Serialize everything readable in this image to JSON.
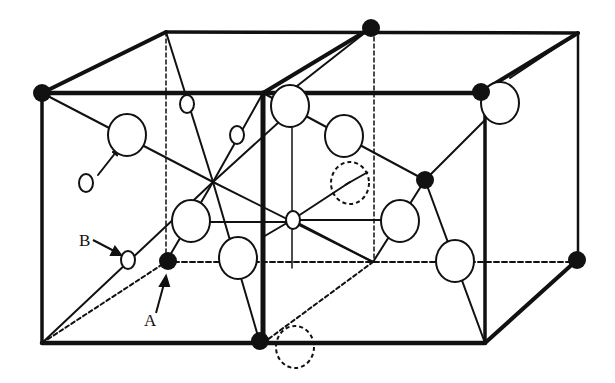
{
  "diagram": {
    "type": "crystal-structure",
    "colors": {
      "line": "#111111",
      "background": "#ffffff",
      "filled_atom": "#111111",
      "open_atom": "#ffffff"
    },
    "labels": [
      {
        "id": "A",
        "text": "A",
        "points_to": "filled atom at back-bottom-left corner (166,262)"
      },
      {
        "id": "B",
        "text": "B",
        "points_to": "small open atom (128,260)"
      }
    ],
    "atom_types": {
      "filled": "black solid circle (corner atoms)",
      "large_open": "large open circle",
      "small_open": "small open circle",
      "dashed": "dashed open circle (hidden/vacant site)"
    }
  }
}
